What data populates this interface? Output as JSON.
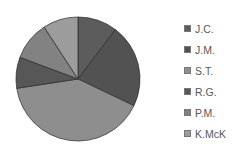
{
  "chart_data": {
    "type": "pie",
    "title": "",
    "categories": [
      "J.C.",
      "J.M.",
      "S.T.",
      "R.G.",
      "P.M.",
      "K.McK"
    ],
    "values": [
      10.3,
      21.8,
      40.5,
      8.1,
      10.1,
      9.2
    ],
    "unit": "percent (estimated from slice angles)",
    "colors": [
      "#5c5c5c",
      "#525252",
      "#8e8e8e",
      "#575757",
      "#828282",
      "#9c9c9c"
    ],
    "start_angle_deg": 0,
    "direction": "clockwise",
    "legend_position": "right"
  },
  "legend": [
    {
      "label": "J.C."
    },
    {
      "label": "J.M."
    },
    {
      "label": "S.T."
    },
    {
      "label": "R.G."
    },
    {
      "label": "P.M."
    },
    {
      "label": "K.McK"
    }
  ]
}
